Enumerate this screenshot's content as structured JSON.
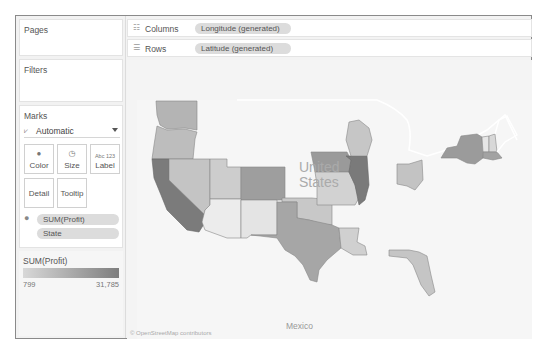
{
  "left_panel": {
    "pages": {
      "title": "Pages"
    },
    "filters": {
      "title": "Filters"
    },
    "marks": {
      "title": "Marks",
      "mark_type": {
        "icon": "automatic-mark-icon",
        "label": "Automatic"
      },
      "buttons": [
        {
          "label": "Color",
          "icon": "color-icon"
        },
        {
          "label": "Size",
          "icon": "size-icon"
        },
        {
          "label": "Label",
          "icon": "label-icon",
          "icon_text": "Abc 123"
        },
        {
          "label": "Detail"
        },
        {
          "label": "Tooltip"
        }
      ],
      "fields": [
        {
          "label": "SUM(Profit)",
          "icon": "color-icon"
        },
        {
          "label": "State"
        }
      ]
    },
    "legend": {
      "title": "SUM(Profit)",
      "min": "799",
      "max": "31,785",
      "color_low": "#d8d8d8",
      "color_high": "#7e7e7e"
    }
  },
  "shelves": {
    "columns": {
      "label": "Columns",
      "icon": "columns-icon",
      "field": "Longitude (generated)"
    },
    "rows": {
      "label": "Rows",
      "icon": "rows-icon",
      "field": "Latitude (generated)"
    }
  },
  "map": {
    "labels": {
      "country": "United States",
      "country_line1": "United",
      "country_line2": "States",
      "neighbor": "Mexico"
    },
    "attribution": "© OpenStreetMap contributors"
  }
}
